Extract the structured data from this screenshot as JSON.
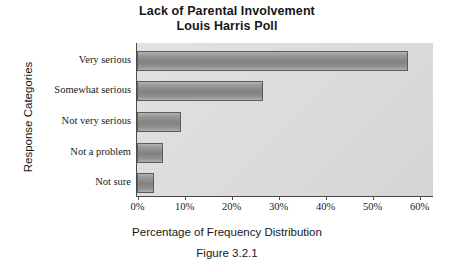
{
  "chart_data": {
    "type": "bar",
    "orientation": "horizontal",
    "title": "Lack of Parental Involvement",
    "subtitle": "Louis Harris Poll",
    "caption": "Figure 3.2.1",
    "xlabel": "Percentage of Frequency Distribution",
    "ylabel": "Response Categories",
    "categories": [
      "Very serious",
      "Somewhat serious",
      "Not very serious",
      "Not a problem",
      "Not sure"
    ],
    "values": [
      57.6,
      26.6,
      9.2,
      5.5,
      3.5
    ],
    "value_labels": [
      "57.6%",
      "26.6%",
      "9.2%",
      "5.5%",
      "3.5%"
    ],
    "xlim": [
      0,
      60
    ],
    "xticks": [
      0,
      10,
      20,
      30,
      40,
      50,
      60
    ],
    "xtick_labels": [
      "0%",
      "10%",
      "20%",
      "30%",
      "40%",
      "50%",
      "60%"
    ],
    "grid": false,
    "legend": false,
    "colors": {
      "bar_fill": "#8a8a8a",
      "bar_edge": "#5c5c5c",
      "plot_background": "#dcdcdc",
      "figure_background": "#ffffff",
      "axis": "#4a4a4a",
      "text": "#1a1a1a"
    }
  }
}
